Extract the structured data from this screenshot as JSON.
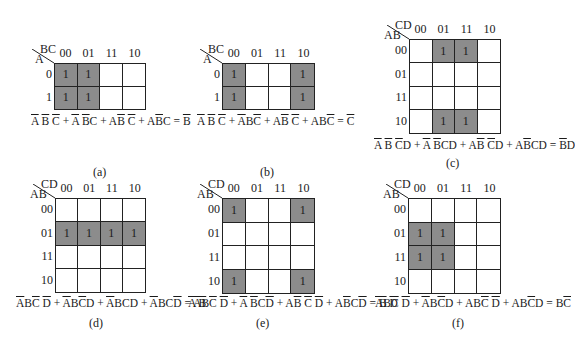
{
  "overbar_color": "#1a1a1a",
  "shade_color": "#8c8c8c",
  "kmaps": [
    {
      "id": "a",
      "caption": "(a)",
      "col_var": "BC",
      "row_var": "A",
      "col_labels": [
        "00",
        "01",
        "11",
        "10"
      ],
      "row_labels": [
        "0",
        "1"
      ],
      "cells": [
        [
          1,
          1,
          0,
          0
        ],
        [
          1,
          1,
          0,
          0
        ]
      ],
      "expression": [
        {
          "t": "A",
          "o": true
        },
        {
          "t": " "
        },
        {
          "t": "B",
          "o": true
        },
        {
          "t": " "
        },
        {
          "t": "C",
          "o": true
        },
        {
          "t": " + "
        },
        {
          "t": "A",
          "o": true
        },
        {
          "t": " "
        },
        {
          "t": "B",
          "o": true
        },
        {
          "t": "C"
        },
        {
          "t": " + A"
        },
        {
          "t": "B",
          "o": true
        },
        {
          "t": " "
        },
        {
          "t": "C",
          "o": true
        },
        {
          "t": " + A"
        },
        {
          "t": "B",
          "o": true
        },
        {
          "t": "C"
        },
        {
          "t": " = "
        },
        {
          "t": "B",
          "o": true
        }
      ],
      "expression_text": "A̅ B̅ C̅ + A̅ B̅C + AB̅ C̅ + AB̅C = B̅",
      "layout": {
        "x": 54,
        "y": 63,
        "cw": 23,
        "ch": 23.5,
        "expr_x": 31,
        "expr_y": 115,
        "cap_x": 93,
        "cap_y": 165
      }
    },
    {
      "id": "b",
      "caption": "(b)",
      "col_var": "BC",
      "row_var": "A",
      "col_labels": [
        "00",
        "01",
        "11",
        "10"
      ],
      "row_labels": [
        "0",
        "1"
      ],
      "cells": [
        [
          1,
          0,
          0,
          1
        ],
        [
          1,
          0,
          0,
          1
        ]
      ],
      "expression": [
        {
          "t": "A",
          "o": true
        },
        {
          "t": " "
        },
        {
          "t": "B",
          "o": true
        },
        {
          "t": " "
        },
        {
          "t": "C",
          "o": true
        },
        {
          "t": " + "
        },
        {
          "t": "A",
          "o": true
        },
        {
          "t": "B"
        },
        {
          "t": "C",
          "o": true
        },
        {
          "t": " + A"
        },
        {
          "t": "B",
          "o": true
        },
        {
          "t": " "
        },
        {
          "t": "C",
          "o": true
        },
        {
          "t": " + AB"
        },
        {
          "t": "C",
          "o": true
        },
        {
          "t": " = "
        },
        {
          "t": "C",
          "o": true
        }
      ],
      "expression_text": "A̅ B̅ C̅ + A̅BC̅ + AB̅ C̅ + ABC̅ = C̅",
      "layout": {
        "x": 222,
        "y": 63,
        "cw": 23.25,
        "ch": 23.5,
        "expr_x": 197,
        "expr_y": 115,
        "cap_x": 260,
        "cap_y": 165
      }
    },
    {
      "id": "c",
      "caption": "(c)",
      "col_var": "CD",
      "row_var": "AB",
      "col_labels": [
        "00",
        "01",
        "11",
        "10"
      ],
      "row_labels": [
        "00",
        "01",
        "11",
        "10"
      ],
      "cells": [
        [
          0,
          1,
          1,
          0
        ],
        [
          0,
          0,
          0,
          0
        ],
        [
          0,
          0,
          0,
          0
        ],
        [
          0,
          1,
          1,
          0
        ]
      ],
      "expression": [
        {
          "t": "A",
          "o": true
        },
        {
          "t": " "
        },
        {
          "t": "B",
          "o": true
        },
        {
          "t": " "
        },
        {
          "t": "C",
          "o": true
        },
        {
          "t": "D"
        },
        {
          "t": " + "
        },
        {
          "t": "A",
          "o": true
        },
        {
          "t": " "
        },
        {
          "t": "B",
          "o": true
        },
        {
          "t": "CD"
        },
        {
          "t": " + A"
        },
        {
          "t": "B",
          "o": true
        },
        {
          "t": " "
        },
        {
          "t": "C",
          "o": true
        },
        {
          "t": "D"
        },
        {
          "t": " + A"
        },
        {
          "t": "B",
          "o": true
        },
        {
          "t": "CD"
        },
        {
          "t": " = "
        },
        {
          "t": "B",
          "o": true
        },
        {
          "t": "D"
        }
      ],
      "expression_text": "A̅ B̅ C̅D + A̅ B̅CD + AB̅ C̅D + AB̅CD = B̅D",
      "layout": {
        "x": 409,
        "y": 39,
        "cw": 23,
        "ch": 23.75,
        "expr_x": 374,
        "expr_y": 139,
        "cap_x": 446,
        "cap_y": 156
      }
    },
    {
      "id": "d",
      "caption": "(d)",
      "col_var": "CD",
      "row_var": "AB",
      "col_labels": [
        "00",
        "01",
        "11",
        "10"
      ],
      "row_labels": [
        "00",
        "01",
        "11",
        "10"
      ],
      "cells": [
        [
          0,
          0,
          0,
          0
        ],
        [
          1,
          1,
          1,
          1
        ],
        [
          0,
          0,
          0,
          0
        ],
        [
          0,
          0,
          0,
          0
        ]
      ],
      "expression": [
        {
          "t": "A",
          "o": true
        },
        {
          "t": "B"
        },
        {
          "t": "C",
          "o": true
        },
        {
          "t": " "
        },
        {
          "t": "D",
          "o": true
        },
        {
          "t": " + "
        },
        {
          "t": "A",
          "o": true
        },
        {
          "t": "B"
        },
        {
          "t": "C",
          "o": true
        },
        {
          "t": "D"
        },
        {
          "t": " + "
        },
        {
          "t": "A",
          "o": true
        },
        {
          "t": "BCD"
        },
        {
          "t": " + "
        },
        {
          "t": "A",
          "o": true
        },
        {
          "t": "BC"
        },
        {
          "t": "D",
          "o": true
        },
        {
          "t": " = "
        },
        {
          "t": "A",
          "o": true
        },
        {
          "t": "B"
        }
      ],
      "expression_text": "A̅BC̅ D̅ + A̅BC̅D + A̅BCD + A̅BCD̅ = A̅B",
      "layout": {
        "x": 55,
        "y": 198,
        "cw": 22.75,
        "ch": 23.75,
        "expr_x": 16,
        "expr_y": 297,
        "cap_x": 89,
        "cap_y": 316
      }
    },
    {
      "id": "e",
      "caption": "(e)",
      "col_var": "CD",
      "row_var": "AB",
      "col_labels": [
        "00",
        "01",
        "11",
        "10"
      ],
      "row_labels": [
        "00",
        "01",
        "11",
        "10"
      ],
      "cells": [
        [
          1,
          0,
          0,
          1
        ],
        [
          0,
          0,
          0,
          0
        ],
        [
          0,
          0,
          0,
          0
        ],
        [
          1,
          0,
          0,
          1
        ]
      ],
      "expression": [
        {
          "t": "A",
          "o": true
        },
        {
          "t": " "
        },
        {
          "t": "B",
          "o": true
        },
        {
          "t": " "
        },
        {
          "t": "C",
          "o": true
        },
        {
          "t": " "
        },
        {
          "t": "D",
          "o": true
        },
        {
          "t": " + "
        },
        {
          "t": "A",
          "o": true
        },
        {
          "t": " "
        },
        {
          "t": "B",
          "o": true
        },
        {
          "t": "C"
        },
        {
          "t": "D",
          "o": true
        },
        {
          "t": " + A"
        },
        {
          "t": "B",
          "o": true
        },
        {
          "t": " "
        },
        {
          "t": "C",
          "o": true
        },
        {
          "t": " "
        },
        {
          "t": "D",
          "o": true
        },
        {
          "t": " + A"
        },
        {
          "t": "B",
          "o": true
        },
        {
          "t": "C"
        },
        {
          "t": "D",
          "o": true
        },
        {
          "t": " = "
        },
        {
          "t": "B",
          "o": true
        },
        {
          "t": " "
        },
        {
          "t": "D",
          "o": true
        }
      ],
      "expression_text": "A̅ B̅ C̅ D̅ + A̅ B̅CD̅ + AB̅ C̅ D̅ + AB̅CD̅ = B̅ D̅",
      "layout": {
        "x": 222,
        "y": 198,
        "cw": 23.25,
        "ch": 24,
        "expr_x": 188,
        "expr_y": 297,
        "cap_x": 256,
        "cap_y": 316
      }
    },
    {
      "id": "f",
      "caption": "(f)",
      "col_var": "CD",
      "row_var": "AB",
      "col_labels": [
        "00",
        "01",
        "11",
        "10"
      ],
      "row_labels": [
        "00",
        "01",
        "11",
        "10"
      ],
      "cells": [
        [
          0,
          0,
          0,
          0
        ],
        [
          1,
          1,
          0,
          0
        ],
        [
          1,
          1,
          0,
          0
        ],
        [
          0,
          0,
          0,
          0
        ]
      ],
      "expression": [
        {
          "t": "A",
          "o": true
        },
        {
          "t": "B"
        },
        {
          "t": "C",
          "o": true
        },
        {
          "t": " "
        },
        {
          "t": "D",
          "o": true
        },
        {
          "t": " + "
        },
        {
          "t": "A",
          "o": true
        },
        {
          "t": "B"
        },
        {
          "t": "C",
          "o": true
        },
        {
          "t": "D"
        },
        {
          "t": " + AB"
        },
        {
          "t": "C",
          "o": true
        },
        {
          "t": " "
        },
        {
          "t": "D",
          "o": true
        },
        {
          "t": " + AB"
        },
        {
          "t": "C",
          "o": true
        },
        {
          "t": "D"
        },
        {
          "t": " = B"
        },
        {
          "t": "C",
          "o": true
        }
      ],
      "expression_text": "A̅BC̅ D̅ + A̅BC̅D + ABC̅ D̅ + ABC̅D = BC̅",
      "layout": {
        "x": 408,
        "y": 198,
        "cw": 23.25,
        "ch": 24,
        "expr_x": 375,
        "expr_y": 297,
        "cap_x": 452,
        "cap_y": 316
      }
    }
  ]
}
